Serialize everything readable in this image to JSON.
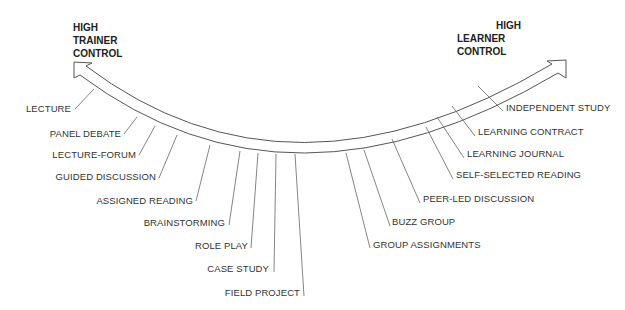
{
  "diagram": {
    "title_left": [
      "HIGH",
      "TRAINER",
      "CONTROL"
    ],
    "title_right": [
      "HIGH",
      "LEARNER",
      "CONTROL"
    ],
    "colors": {
      "line": "#555555",
      "text": "#333333",
      "background": "#ffffff"
    },
    "left_methods": [
      "LECTURE",
      "PANEL DEBATE",
      "LECTURE-FORUM",
      "GUIDED DISCUSSION",
      "ASSIGNED READING",
      "BRAINSTORMING",
      "ROLE PLAY",
      "CASE STUDY",
      "FIELD PROJECT"
    ],
    "right_methods": [
      "GROUP ASSIGNMENTS",
      "BUZZ GROUP",
      "PEER-LED DISCUSSION",
      "SELF-SELECTED READING",
      "LEARNING JOURNAL",
      "LEARNING CONTRACT",
      "INDEPENDENT STUDY"
    ]
  }
}
